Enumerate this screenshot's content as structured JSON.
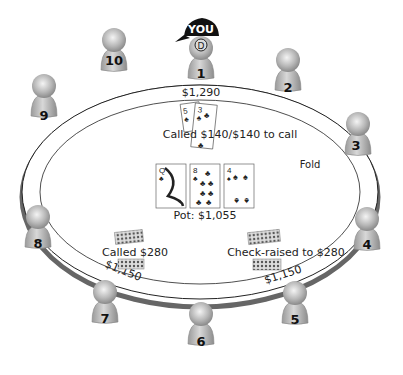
{
  "table": {
    "hero_badge": "YOU",
    "dealer_button": "D",
    "stacks": {
      "seat1": "$1,290",
      "seat7": "$1,150",
      "seat5": "$1,150"
    },
    "hero_action": "Called $140/$140 to call",
    "hero_cards": [
      {
        "rank": "5",
        "suit": "♣"
      },
      {
        "rank": "3",
        "suit": "♣"
      }
    ],
    "board": [
      {
        "rank": "Q",
        "suit": "♣"
      },
      {
        "rank": "8",
        "suit": "♣"
      },
      {
        "rank": "4",
        "suit": "♠"
      }
    ],
    "pot": "Pot: $1,055",
    "actions": {
      "seat3": "Fold",
      "seat7": "Called $280",
      "seat5": "Check-raised to $280"
    }
  },
  "seats": [
    {
      "num": "1"
    },
    {
      "num": "2"
    },
    {
      "num": "3"
    },
    {
      "num": "4"
    },
    {
      "num": "5"
    },
    {
      "num": "6"
    },
    {
      "num": "7"
    },
    {
      "num": "8"
    },
    {
      "num": "9"
    },
    {
      "num": "10"
    }
  ]
}
